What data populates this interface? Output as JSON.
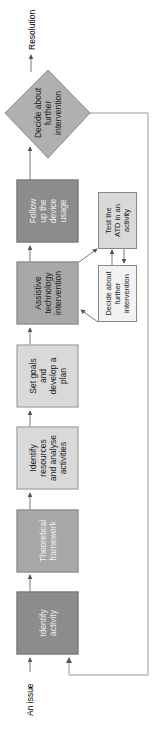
{
  "colors": {
    "dark": "#8c8c8c",
    "medium": "#a8a8a8",
    "light": "#d9d9d9",
    "diamond": "#b0b0b0",
    "line": "#555555",
    "feedback_line": "#999999"
  },
  "start_label": "An issue",
  "end_label": "Resolution",
  "steps": [
    {
      "label": "Identify activity",
      "shade": "dark"
    },
    {
      "label": "Theoretical framework",
      "shade": "medium"
    },
    {
      "label": "Identify resources and analyse activities",
      "shade": "light"
    },
    {
      "label": "Set goals and develop a plan",
      "shade": "light"
    },
    {
      "label": "Assistive technology intervention",
      "shade": "medium"
    },
    {
      "label": "Follow up the device usage",
      "shade": "dark"
    }
  ],
  "sub_loop": [
    {
      "label": "Test the ATD in an activity"
    },
    {
      "label": "Decide about further intervention"
    }
  ],
  "decision": {
    "label": "Decide about further intervention"
  }
}
